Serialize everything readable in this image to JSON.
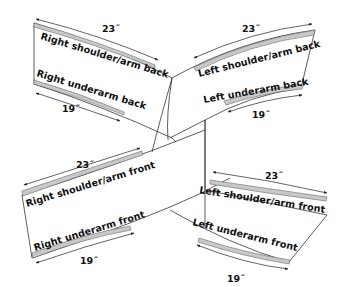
{
  "diagram": {
    "colors": {
      "outline": "#333333",
      "seam_allowance": "#c8c8c8",
      "text": "#111111",
      "background": "#ffffff"
    },
    "panels": [
      {
        "id": "right-back",
        "shoulder_label": "Right shoulder/arm back",
        "underarm_label": "Right underarm back",
        "shoulder_length": "23˝",
        "underarm_length": "19˝"
      },
      {
        "id": "left-back",
        "shoulder_label": "Left shoulder/arm back",
        "underarm_label": "Left underarm back",
        "shoulder_length": "23˝",
        "underarm_length": "19˝"
      },
      {
        "id": "right-front",
        "shoulder_label": "Right shoulder/arm front",
        "underarm_label": "Right underarm front",
        "shoulder_length": "23˝",
        "underarm_length": "19˝"
      },
      {
        "id": "left-front",
        "shoulder_label": "Left shoulder/arm front",
        "underarm_label": "Left underarm front",
        "shoulder_length": "23˝",
        "underarm_length": "19˝"
      }
    ]
  }
}
